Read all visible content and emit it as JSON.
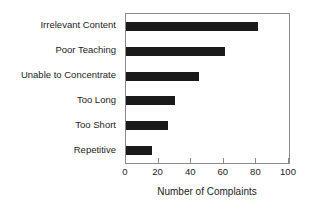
{
  "chart_data": {
    "type": "bar",
    "orientation": "horizontal",
    "title": "",
    "xlabel": "Number of Complaints",
    "ylabel": "",
    "xlim": [
      0,
      100
    ],
    "xticks": [
      0,
      20,
      40,
      60,
      80,
      100
    ],
    "xtick_labels": [
      "0",
      "20",
      "40",
      "60",
      "80",
      "100"
    ],
    "grid": false,
    "legend": false,
    "bar_color": "#1a1a1a",
    "axis_color": "#8a8a8a",
    "categories": [
      "Irrelevant Content",
      "Poor Teaching",
      "Unable to Concentrate",
      "Too Long",
      "Too Short",
      "Repetitive"
    ],
    "values": [
      81,
      61,
      45,
      30,
      26,
      16
    ]
  }
}
